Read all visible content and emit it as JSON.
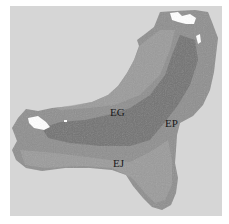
{
  "map": {
    "subject": "island satellite image (grayscale)",
    "colors": {
      "background": "#ffffff",
      "frame": "#d6d6d6",
      "land": "#8f8f8f",
      "land_dark": "#6e6e6e",
      "land_light": "#a5a5a5",
      "cloud": "#ffffff"
    },
    "labels": [
      {
        "id": "EG",
        "text": "EG",
        "x": 110,
        "y": 107
      },
      {
        "id": "EP",
        "text": "EP",
        "x": 165,
        "y": 118
      },
      {
        "id": "EJ",
        "text": "EJ",
        "x": 113,
        "y": 158
      }
    ]
  }
}
